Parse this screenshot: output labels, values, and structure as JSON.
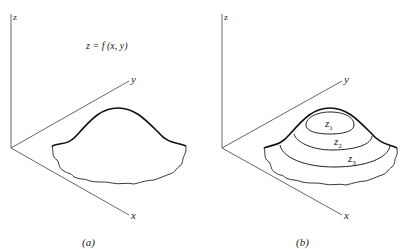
{
  "panel_a": {
    "z_label": "z",
    "y_label": "y",
    "x_label": "x",
    "equation": "z = f (x, y)",
    "caption": "(a)"
  },
  "panel_b": {
    "z_label": "z",
    "y_label": "y",
    "x_label": "x",
    "contours": [
      {
        "name": "z",
        "sub": "1"
      },
      {
        "name": "z",
        "sub": "2"
      },
      {
        "name": "z",
        "sub": "3"
      }
    ],
    "caption": "(b)"
  }
}
